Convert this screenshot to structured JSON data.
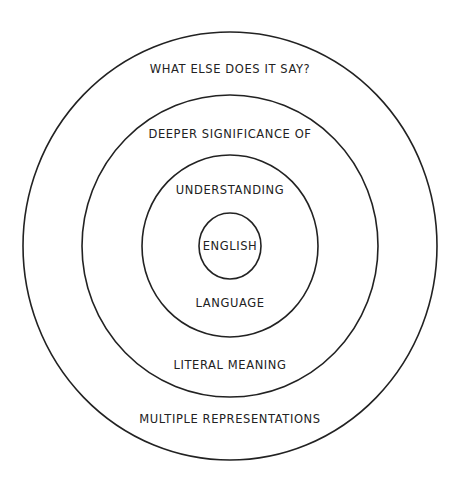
{
  "diagram": {
    "type": "concentric-circles",
    "center": {
      "x": 230,
      "y": 246
    },
    "stroke_color": "#222222",
    "background": "#ffffff",
    "rings": [
      {
        "name": "outer",
        "rx": 207,
        "ry": 214
      },
      {
        "name": "second",
        "rx": 148,
        "ry": 151
      },
      {
        "name": "third",
        "rx": 88,
        "ry": 91
      },
      {
        "name": "inner",
        "rx": 31,
        "ry": 33
      }
    ],
    "labels": {
      "outer_top": "WHAT ELSE DOES IT SAY?",
      "second_top": "DEEPER SIGNIFICANCE OF",
      "third_top": "UNDERSTANDING",
      "center": "ENGLISH",
      "third_bottom": "LANGUAGE",
      "second_bottom": "LITERAL MEANING",
      "outer_bottom": "MULTIPLE REPRESENTATIONS"
    }
  }
}
